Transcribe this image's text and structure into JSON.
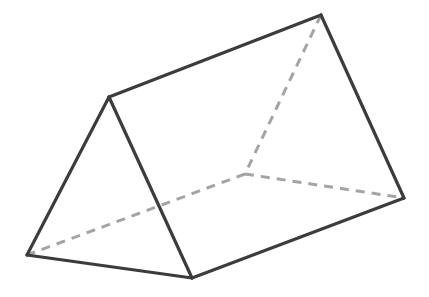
{
  "figure": {
    "kind": "triangular-prism",
    "background_color": "#ffffff",
    "canvas": {
      "width": 429,
      "height": 297
    },
    "colors": {
      "visible_edge": "#3a3c40",
      "hidden_edge": "#a2a4a7",
      "face": "#ffffff"
    },
    "stroke": {
      "visible_width": 3.2,
      "hidden_width": 3.0,
      "hidden_dash_pattern": "9 7"
    },
    "vertices": {
      "front_apex": {
        "id": "A",
        "x": 109,
        "y": 97,
        "label": "front top apex",
        "hidden": false
      },
      "front_bottom_left": {
        "id": "B",
        "x": 27,
        "y": 255,
        "label": "front bottom left",
        "hidden": false
      },
      "front_bottom_right": {
        "id": "C",
        "x": 192,
        "y": 278,
        "label": "front bottom right",
        "hidden": false
      },
      "back_apex": {
        "id": "D",
        "x": 321,
        "y": 15,
        "label": "back top apex",
        "hidden": false
      },
      "back_bottom_right": {
        "id": "E",
        "x": 404,
        "y": 198,
        "label": "back bottom right",
        "hidden": false
      },
      "back_bottom_left": {
        "id": "F",
        "x": 245,
        "y": 174,
        "label": "back bottom left (hidden)",
        "hidden": true
      }
    },
    "edges_visible": [
      {
        "name": "front-left-edge",
        "from": "A",
        "to": "B",
        "d": "M 109 97 L 27 255"
      },
      {
        "name": "front-bottom-edge",
        "from": "B",
        "to": "C",
        "d": "M 27 255 L 192 278"
      },
      {
        "name": "front-right-edge",
        "from": "C",
        "to": "A",
        "d": "M 192 278 L 109 97"
      },
      {
        "name": "top-ridge-edge",
        "from": "A",
        "to": "D",
        "d": "M 109 97 L 321 15"
      },
      {
        "name": "back-right-edge",
        "from": "D",
        "to": "E",
        "d": "M 321 15 L 404 198"
      },
      {
        "name": "bottom-right-edge",
        "from": "C",
        "to": "E",
        "d": "M 192 278 L 404 198"
      }
    ],
    "edges_hidden": [
      {
        "name": "hidden-back-left-edge",
        "from": "D",
        "to": "F",
        "d": "M 321 15 L 245 174"
      },
      {
        "name": "hidden-bottom-back-edge",
        "from": "F",
        "to": "E",
        "d": "M 245 174 L 404 198"
      },
      {
        "name": "hidden-bottom-left-edge",
        "from": "F",
        "to": "B",
        "d": "M 245 174 L 27 255"
      }
    ],
    "faces": [
      {
        "name": "front-triangle-face",
        "d": "M 109 97 L 27 255 L 192 278 Z"
      },
      {
        "name": "top-rectangle-face",
        "d": "M 109 97 L 321 15 L 404 198 L 192 278 Z"
      },
      {
        "name": "back-triangle-face",
        "d": "M 321 15 L 404 198 L 245 174 Z"
      }
    ]
  }
}
